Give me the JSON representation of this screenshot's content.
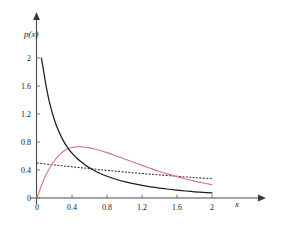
{
  "chart_data": {
    "type": "line",
    "title": "",
    "subtitle": "",
    "xlabel": "x",
    "ylabel": "p(x)",
    "xlim": [
      0,
      2.2
    ],
    "ylim": [
      0,
      2.2
    ],
    "xticks": [
      0,
      0.4,
      0.8,
      1.2,
      1.6,
      2
    ],
    "xticklabels": [
      "0",
      "0.4",
      "0.8",
      "1.2",
      "1.6",
      "2"
    ],
    "yticks": [
      0,
      0.4,
      0.8,
      1.2,
      1.6,
      2
    ],
    "yticklabels": [
      "0",
      "0.4",
      "0.8",
      "1.2",
      "1.6",
      "2"
    ],
    "grid": false,
    "legend": "none",
    "axis_style": "arrow-terminated",
    "series": [
      {
        "name": "solid-black-decaying",
        "color": "#1c1c1c",
        "style": "solid",
        "x": [
          0.05,
          0.08,
          0.11,
          0.15,
          0.2,
          0.25,
          0.3,
          0.35,
          0.4,
          0.45,
          0.5,
          0.55,
          0.6,
          0.65,
          0.7,
          0.75,
          0.8,
          0.9,
          1.0,
          1.1,
          1.2,
          1.3,
          1.4,
          1.5,
          1.6,
          1.7,
          1.8,
          1.9,
          2.0
        ],
        "y": [
          2.0,
          1.78,
          1.56,
          1.33,
          1.11,
          0.95,
          0.82,
          0.72,
          0.64,
          0.575,
          0.52,
          0.473,
          0.432,
          0.396,
          0.364,
          0.336,
          0.311,
          0.268,
          0.233,
          0.204,
          0.18,
          0.159,
          0.141,
          0.125,
          0.112,
          0.1,
          0.089,
          0.08,
          0.072
        ]
      },
      {
        "name": "red-unimodal",
        "color": "#d9747c",
        "style": "solid",
        "x": [
          0,
          0.05,
          0.1,
          0.15,
          0.2,
          0.25,
          0.3,
          0.35,
          0.4,
          0.45,
          0.5,
          0.55,
          0.6,
          0.65,
          0.7,
          0.8,
          0.9,
          1.0,
          1.1,
          1.2,
          1.3,
          1.4,
          1.5,
          1.6,
          1.7,
          1.8,
          1.9,
          2.0
        ],
        "y": [
          0.0,
          0.175,
          0.325,
          0.44,
          0.535,
          0.61,
          0.665,
          0.702,
          0.722,
          0.73,
          0.731,
          0.726,
          0.716,
          0.703,
          0.687,
          0.648,
          0.604,
          0.558,
          0.512,
          0.466,
          0.422,
          0.38,
          0.341,
          0.305,
          0.272,
          0.241,
          0.214,
          0.19
        ]
      },
      {
        "name": "black-dashed-slow-decay",
        "color": "#2a2a2a",
        "style": "dashed",
        "x": [
          0,
          0.2,
          0.4,
          0.6,
          0.8,
          1.0,
          1.2,
          1.4,
          1.6,
          1.8,
          2.0
        ],
        "y": [
          0.5,
          0.472,
          0.445,
          0.42,
          0.395,
          0.372,
          0.35,
          0.33,
          0.31,
          0.292,
          0.276
        ]
      }
    ]
  },
  "axis": {
    "y_label_text": "p(x)",
    "x_label_text": "x"
  }
}
